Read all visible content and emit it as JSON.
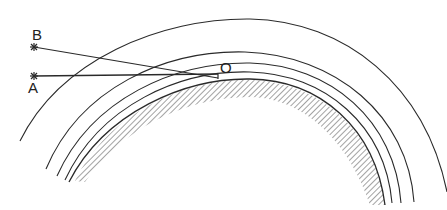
{
  "diagram": {
    "labels": {
      "point_b": "B",
      "point_a": "A",
      "point_o": "O"
    },
    "stroke_color": "#2a2a2a",
    "background": "#ffffff"
  }
}
